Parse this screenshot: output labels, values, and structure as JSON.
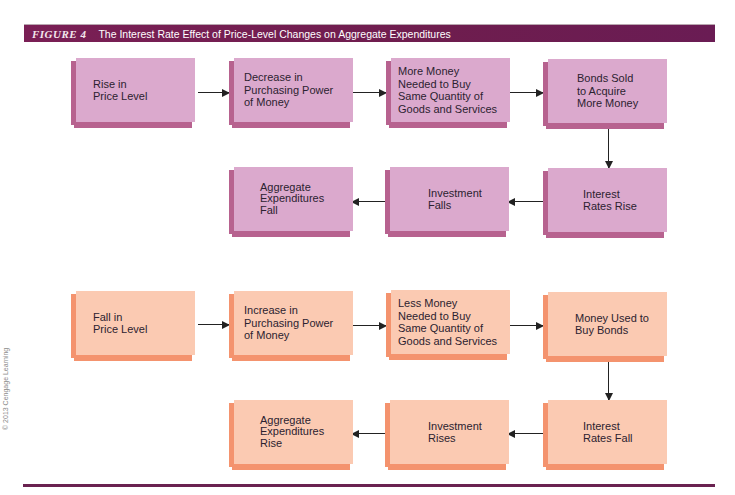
{
  "header": {
    "figure_label": "FIGURE 4",
    "title": "The Interest Rate Effect of Price-Level Changes on Aggregate Expenditures"
  },
  "copyright": "© 2013 Cengage Learning",
  "colors": {
    "header_bar": "#7a1f55",
    "pink_face": "#dba9cd",
    "pink_edge": "#b7628f",
    "orange_face": "#fbcab2",
    "orange_edge": "#f4936e",
    "arrow": "#222222"
  },
  "flow_rise": {
    "boxes": [
      "Rise in\nPrice Level",
      "Decrease in\nPurchasing Power\nof Money",
      "More Money\nNeeded to Buy\nSame Quantity of\nGoods and Services",
      "Bonds Sold\nto Acquire\nMore Money",
      "Interest\nRates Rise",
      "Investment\nFalls",
      "Aggregate\nExpenditures\nFall"
    ]
  },
  "flow_fall": {
    "boxes": [
      "Fall in\nPrice Level",
      "Increase in\nPurchasing Power\nof Money",
      "Less Money\nNeeded to Buy\nSame Quantity of\nGoods and Services",
      "Money Used to\nBuy Bonds",
      "Interest\nRates Fall",
      "Investment\nRises",
      "Aggregate\nExpenditures\nRise"
    ]
  }
}
